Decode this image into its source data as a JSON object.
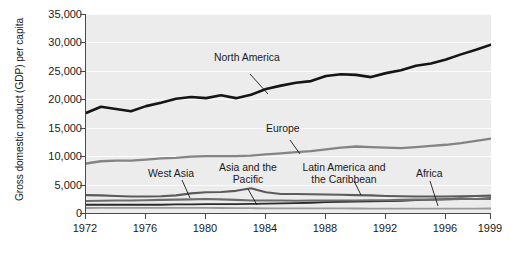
{
  "chart_data": {
    "type": "line",
    "title": "",
    "xlabel": "",
    "ylabel": "Gross domestic product (GDP) per capita",
    "xlim": [
      1972,
      1999
    ],
    "ylim": [
      0,
      35000
    ],
    "grid": true,
    "legend_position": "inline-annotations",
    "x": [
      1972,
      1973,
      1974,
      1975,
      1976,
      1977,
      1978,
      1979,
      1980,
      1981,
      1982,
      1983,
      1984,
      1985,
      1986,
      1987,
      1988,
      1989,
      1990,
      1991,
      1992,
      1993,
      1994,
      1995,
      1996,
      1997,
      1998,
      1999
    ],
    "y_ticks": [
      0,
      5000,
      10000,
      15000,
      20000,
      25000,
      30000,
      35000
    ],
    "y_tick_labels": [
      "0",
      "5,000",
      "10,000",
      "15,000",
      "20,000",
      "25,000",
      "30,000",
      "35,000"
    ],
    "x_ticks": [
      1972,
      1976,
      1980,
      1984,
      1988,
      1992,
      1996,
      1999
    ],
    "x_tick_labels": [
      "1972",
      "1976",
      "1980",
      "1984",
      "1988",
      "1992",
      "1996",
      "1999"
    ],
    "series": [
      {
        "name": "North America",
        "color": "#151515",
        "width": 2.6,
        "values": [
          17600,
          18700,
          18300,
          17900,
          18800,
          19400,
          20100,
          20400,
          20200,
          20700,
          20200,
          20800,
          21800,
          22400,
          22900,
          23200,
          24100,
          24400,
          24300,
          23900,
          24600,
          25100,
          25900,
          26300,
          27000,
          27900,
          28700,
          29600
        ]
      },
      {
        "name": "Europe",
        "color": "#848484",
        "width": 2.3,
        "values": [
          8700,
          9100,
          9200,
          9200,
          9400,
          9600,
          9700,
          9900,
          10000,
          10000,
          10000,
          10100,
          10300,
          10500,
          10700,
          10900,
          11200,
          11500,
          11700,
          11600,
          11500,
          11400,
          11600,
          11800,
          12000,
          12300,
          12700,
          13100
        ]
      },
      {
        "name": "West Asia",
        "color": "#5b5b5b",
        "width": 2.1,
        "values": [
          3150,
          3100,
          3000,
          2900,
          2900,
          2950,
          3100,
          3450,
          3650,
          3700,
          3900,
          4350,
          3650,
          3350,
          3350,
          3300,
          3250,
          3200,
          3150,
          3100,
          3000,
          2950,
          2900,
          2900,
          2900,
          2950,
          3000,
          3050
        ]
      },
      {
        "name": "Asia and the Pacific",
        "color": "#2a2a2a",
        "width": 1.8,
        "values": [
          1450,
          1450,
          1450,
          1450,
          1450,
          1450,
          1500,
          1500,
          1550,
          1550,
          1550,
          1600,
          1650,
          1700,
          1750,
          1800,
          1900,
          1950,
          2000,
          2050,
          2100,
          2150,
          2250,
          2350,
          2450,
          2550,
          2500,
          2600
        ]
      },
      {
        "name": "Latin America and the Caribbean",
        "color": "#6d6d6d",
        "width": 2.1,
        "values": [
          2100,
          2150,
          2200,
          2200,
          2250,
          2300,
          2350,
          2400,
          2450,
          2400,
          2300,
          2200,
          2200,
          2200,
          2150,
          2200,
          2200,
          2200,
          2200,
          2250,
          2250,
          2300,
          2350,
          2350,
          2400,
          2450,
          2450,
          2450
        ]
      },
      {
        "name": "Africa",
        "color": "#9a9a9a",
        "width": 1.8,
        "values": [
          880,
          900,
          910,
          900,
          890,
          890,
          890,
          900,
          900,
          880,
          860,
          840,
          830,
          820,
          810,
          800,
          800,
          800,
          790,
          780,
          770,
          760,
          760,
          760,
          770,
          780,
          780,
          790
        ]
      }
    ],
    "annotations": [
      {
        "label": "North America",
        "id": "north-america"
      },
      {
        "label": "Europe",
        "id": "europe"
      },
      {
        "label": "West Asia",
        "id": "west-asia"
      },
      {
        "label": "Asia and the Pacific",
        "line1": "Asia and the",
        "line2": "Pacific",
        "id": "asia-pacific"
      },
      {
        "label": "Latin America and the Caribbean",
        "line1": "Latin America and",
        "line2": "the Caribbean",
        "id": "latin-america"
      },
      {
        "label": "Africa",
        "id": "africa"
      }
    ],
    "colors": {
      "plot_background": "#ececec",
      "gridline": "#fbfbfb",
      "axis": "#4a4a4a",
      "text": "#1a1a1a",
      "page_background": "#ffffff"
    }
  }
}
